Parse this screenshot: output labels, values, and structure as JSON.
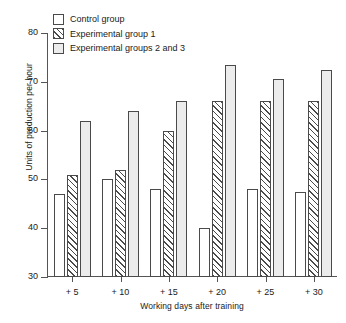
{
  "chart_data": {
    "type": "bar",
    "title": "",
    "xlabel": "Working days after training",
    "ylabel": "Units of production per hour",
    "categories": [
      "+ 5",
      "+ 10",
      "+ 15",
      "+ 20",
      "+ 25",
      "+ 30"
    ],
    "series": [
      {
        "name": "Control group",
        "fill": "white",
        "values": [
          47,
          50,
          48,
          40,
          48,
          47.5
        ]
      },
      {
        "name": "Experimental group 1",
        "fill": "hatched",
        "values": [
          51,
          52,
          60,
          66,
          66,
          66
        ]
      },
      {
        "name": "Experimental groups 2 and 3",
        "fill": "lightgray",
        "values": [
          62,
          64,
          66,
          73.5,
          70.5,
          72.5
        ]
      }
    ],
    "ylim": [
      30,
      80
    ],
    "yticks": [
      30,
      40,
      50,
      60,
      70,
      80
    ],
    "ytick_labels": [
      "30",
      "40",
      "50",
      "60",
      "70",
      "80"
    ],
    "grid": false,
    "legend_position": "top-left",
    "colors": {
      "bar_outline": "#4a4a4a",
      "control_fill": "#ffffff",
      "exp1_hatch": "#4a4a4a",
      "exp23_fill": "#ececec",
      "axis": "#555555",
      "text": "#1a1a1a"
    }
  },
  "legend": {
    "items": [
      {
        "label": "Control group"
      },
      {
        "label": "Experimental group 1"
      },
      {
        "label": "Experimental groups 2 and 3"
      }
    ]
  }
}
